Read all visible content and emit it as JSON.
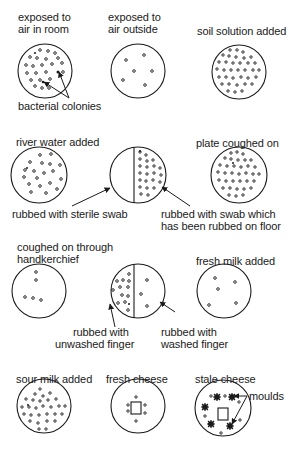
{
  "labels": {
    "air_room": [
      "exposed to",
      "air in room"
    ],
    "air_outside": [
      "exposed to",
      "air outside"
    ],
    "soil": "soil solution added",
    "bacterial_colonies": "bacterial colonies",
    "river": "river water added",
    "coughed": "plate coughed on",
    "sterile_swab": "rubbed with sterile swab",
    "floor_swab": [
      "rubbed with swab which",
      "has been rubbed on floor"
    ],
    "handkerchief": [
      "coughed on through",
      "handkerchief"
    ],
    "fresh_milk": "fresh milk added",
    "unwashed": [
      "rubbed with",
      "unwashed finger"
    ],
    "washed": [
      "rubbed with",
      "washed finger"
    ],
    "sour_milk": "sour milk added",
    "fresh_cheese": "fresh cheese",
    "stale_cheese": "stale cheese",
    "moulds": "moulds"
  },
  "colors": {
    "ink": "#1a1a1a",
    "background": "#ffffff"
  }
}
